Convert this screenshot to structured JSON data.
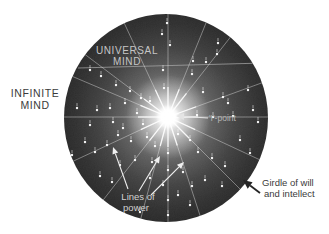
{
  "diagram": {
    "colors": {
      "background": "#ffffff",
      "ray": "#f2f2f2",
      "star": "#ffffff",
      "chord": "#a8a8a8",
      "light_label": "#c6c6c6",
      "mid_label": "#b5b5b5",
      "power_label": "#d2d2d2",
      "dark_label": "#3b3b3b",
      "white_arrow": "#f0f0f0",
      "black_arrow": "#252525"
    },
    "labels": {
      "universal_mind": {
        "line1": "UNIVERSAL",
        "line2": "MIND"
      },
      "infinite_mind": {
        "line1": "INFINITE",
        "line2": "MIND"
      },
      "i_point": {
        "text": "'I'-point"
      },
      "lines_of_power": {
        "line1": "Lines of",
        "line2": "power"
      },
      "girdle": {
        "line1": "Girdle of will",
        "line2": "and intellect"
      }
    },
    "center": {
      "x": 168,
      "y": 117
    },
    "sphere": {
      "cx": 166,
      "cy": 118,
      "rx": 102,
      "ry": 104
    },
    "ray_length": 118,
    "flare_length": 30,
    "rays": [
      0,
      20,
      52,
      68,
      90,
      115,
      143,
      157,
      180,
      205,
      232,
      255,
      270,
      288,
      315,
      335
    ],
    "chord": {
      "x1": 78,
      "y1": 68,
      "x2": 264,
      "y2": 63
    },
    "sphere_gradient": [
      {
        "offset": 0,
        "color": "#ffffff"
      },
      {
        "offset": 0.05,
        "color": "#ededed"
      },
      {
        "offset": 0.12,
        "color": "#b5b5b5"
      },
      {
        "offset": 0.22,
        "color": "#868686"
      },
      {
        "offset": 0.38,
        "color": "#5c5c5c"
      },
      {
        "offset": 0.58,
        "color": "#3f3f3f"
      },
      {
        "offset": 0.78,
        "color": "#2d2d2d"
      },
      {
        "offset": 1,
        "color": "#202020"
      }
    ],
    "stars": [
      [
        167,
        23
      ],
      [
        162,
        34
      ],
      [
        170,
        45
      ],
      [
        218,
        43
      ],
      [
        217,
        54
      ],
      [
        206,
        62
      ],
      [
        193,
        61
      ],
      [
        90,
        70
      ],
      [
        101,
        76
      ],
      [
        116,
        85
      ],
      [
        130,
        91
      ],
      [
        141,
        98
      ],
      [
        163,
        70
      ],
      [
        164,
        88
      ],
      [
        150,
        101
      ],
      [
        192,
        74
      ],
      [
        203,
        92
      ],
      [
        223,
        97
      ],
      [
        228,
        103
      ],
      [
        248,
        90
      ],
      [
        253,
        110
      ],
      [
        77,
        108
      ],
      [
        97,
        110
      ],
      [
        110,
        108
      ],
      [
        125,
        103
      ],
      [
        113,
        122
      ],
      [
        123,
        128
      ],
      [
        137,
        113
      ],
      [
        143,
        124
      ],
      [
        197,
        115
      ],
      [
        213,
        117
      ],
      [
        233,
        116
      ],
      [
        258,
        122
      ],
      [
        90,
        125
      ],
      [
        85,
        142
      ],
      [
        95,
        152
      ],
      [
        107,
        145
      ],
      [
        72,
        155
      ],
      [
        118,
        135
      ],
      [
        131,
        141
      ],
      [
        147,
        137
      ],
      [
        155,
        146
      ],
      [
        178,
        134
      ],
      [
        190,
        140
      ],
      [
        198,
        152
      ],
      [
        212,
        158
      ],
      [
        225,
        166
      ],
      [
        120,
        165
      ],
      [
        135,
        160
      ],
      [
        152,
        162
      ],
      [
        168,
        153
      ],
      [
        168,
        170
      ],
      [
        183,
        172
      ],
      [
        192,
        186
      ],
      [
        100,
        176
      ],
      [
        112,
        182
      ],
      [
        150,
        178
      ],
      [
        163,
        185
      ],
      [
        178,
        195
      ],
      [
        205,
        180
      ],
      [
        222,
        186
      ],
      [
        140,
        212
      ],
      [
        168,
        200
      ],
      [
        168,
        215
      ],
      [
        190,
        205
      ],
      [
        240,
        140
      ],
      [
        250,
        153
      ]
    ],
    "arrows": [
      {
        "name": "lines-of-power-arrow-1",
        "x1": 128,
        "y1": 189,
        "x2": 113,
        "y2": 147,
        "width": 1.1,
        "head": 7,
        "hw": 3,
        "color": "#f0f0f0"
      },
      {
        "name": "lines-of-power-arrow-2",
        "x1": 139,
        "y1": 191,
        "x2": 160,
        "y2": 156,
        "width": 1.1,
        "head": 7,
        "hw": 3,
        "color": "#f0f0f0"
      },
      {
        "name": "lines-of-power-arrow-3",
        "x1": 151,
        "y1": 195,
        "x2": 184,
        "y2": 162,
        "width": 1.1,
        "head": 7,
        "hw": 3,
        "color": "#f0f0f0"
      },
      {
        "name": "i-point-arrow",
        "x1": 208,
        "y1": 118,
        "x2": 176,
        "y2": 116,
        "width": 1.2,
        "head": 8,
        "hw": 3.5,
        "color": "#e4e4e4"
      },
      {
        "name": "girdle-arrow",
        "x1": 260,
        "y1": 193,
        "x2": 243,
        "y2": 180,
        "width": 1.8,
        "head": 9,
        "hw": 4,
        "color": "#252525"
      }
    ]
  }
}
